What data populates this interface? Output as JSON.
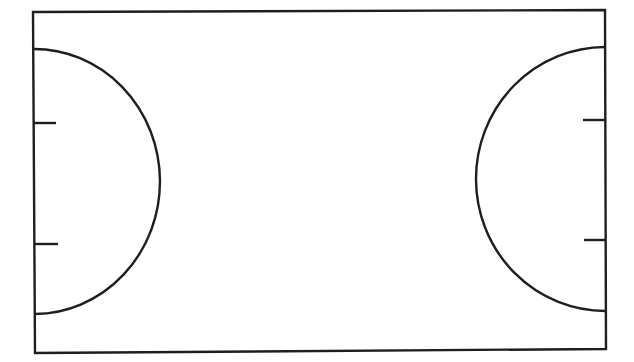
{
  "diagram": {
    "type": "court-outline",
    "stroke_color": "#1e1e1e",
    "background": "#ffffff",
    "boundary": {
      "top_left": [
        33,
        12
      ],
      "top_right": [
        605,
        10
      ],
      "bottom_right": [
        606,
        349
      ],
      "bottom_left": [
        35,
        353
      ]
    },
    "left_arc": {
      "start": [
        33,
        49
      ],
      "end": [
        35,
        314
      ],
      "apex_x": 160
    },
    "right_arc": {
      "start": [
        605,
        47
      ],
      "end": [
        606,
        311
      ],
      "apex_x": 476
    },
    "left_ticks": [
      {
        "y": 123,
        "x1": 33,
        "x2": 56
      },
      {
        "y": 244,
        "x1": 35,
        "x2": 58
      }
    ],
    "right_ticks": [
      {
        "y": 120,
        "x1": 583,
        "x2": 605
      },
      {
        "y": 240,
        "x1": 584,
        "x2": 606
      }
    ]
  }
}
